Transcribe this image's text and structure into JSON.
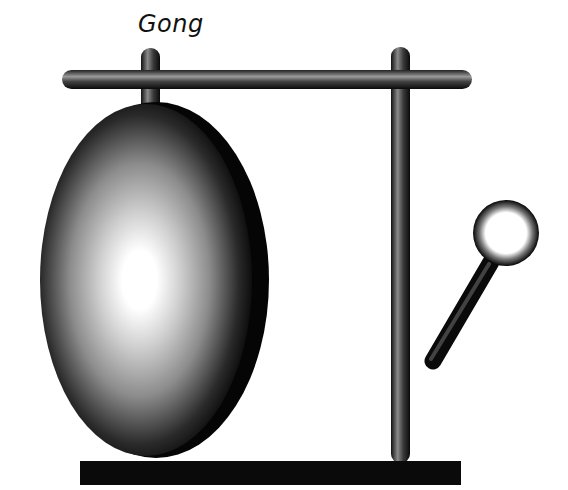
{
  "illustration": {
    "title": "Gong",
    "parts": [
      "gong-disc",
      "stand-crossbar",
      "left-post",
      "right-post",
      "base",
      "mallet"
    ]
  },
  "colors": {
    "background": "#ffffff",
    "ink": "#111111",
    "highlight": "#ffffff"
  }
}
